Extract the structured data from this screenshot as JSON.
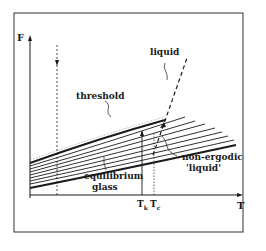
{
  "figure": {
    "axes": {
      "y_label": "F",
      "x_label": "T",
      "x_ticks": [
        "T_k",
        "T_c"
      ],
      "x_tick_display": [
        {
          "main": "T",
          "sub": "k"
        },
        {
          "main": "T",
          "sub": "c"
        }
      ]
    },
    "annotations": {
      "liquid": "liquid",
      "threshold": "threshold",
      "non_ergodic_line1": "non-ergodic",
      "non_ergodic_line2": "'liquid'",
      "equilibrium_line1": "equilibrium",
      "equilibrium_line2": "glass"
    },
    "colors": {
      "ink": "#1a1a1a",
      "grey_line": "#9a9a9a",
      "background": "#ffffff"
    }
  }
}
